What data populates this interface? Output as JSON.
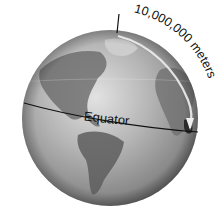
{
  "diagram": {
    "equator_label": "Equator",
    "distance_label": "10,000,000 meters",
    "colors": {
      "ocean_light": "#d9d9d9",
      "ocean_mid": "#9a9a9a",
      "ocean_dark": "#4a4a4a",
      "land": "#6a6a6a",
      "line": "#111111",
      "text": "#111111"
    }
  }
}
